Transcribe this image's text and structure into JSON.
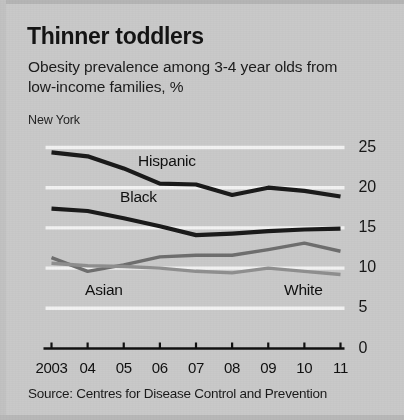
{
  "headline": "Thinner toddlers",
  "subtitle": "Obesity prevalence among 3-4 year olds from low-income families, %",
  "region": "New York",
  "source": "Source: Centres for Disease Control and Prevention",
  "colors": {
    "background": "#c9c9c9",
    "gridline": "#f2f2f2",
    "axis": "#111111",
    "dark_series": "#1a1a1a",
    "mid_series": "#6e6e6e",
    "light_series": "#8f8f8f",
    "text": "#141414"
  },
  "chart_data": {
    "type": "line",
    "title": "Thinner toddlers",
    "subtitle": "Obesity prevalence among 3-4 year olds from low-income families, %",
    "annotation": "New York",
    "source": "Source: Centres for Disease Control and Prevention",
    "xlabel": "",
    "ylabel": "",
    "x": [
      2003,
      2004,
      2005,
      2006,
      2007,
      2008,
      2009,
      2010,
      2011
    ],
    "tick_labels": [
      "2003",
      "04",
      "05",
      "06",
      "07",
      "08",
      "09",
      "10",
      "11"
    ],
    "ylim": [
      0,
      25
    ],
    "yticks": [
      0,
      5,
      10,
      15,
      20,
      25
    ],
    "ytick_labels": [
      "0",
      "5",
      "10",
      "15",
      "20",
      "25"
    ],
    "grid": "horizontal",
    "legend": "inline-labels",
    "series": [
      {
        "name": "Hispanic",
        "color": "#1a1a1a",
        "width": 4.2,
        "values": [
          24.4,
          23.9,
          22.4,
          20.5,
          20.4,
          19.1,
          20.0,
          19.6,
          18.9
        ]
      },
      {
        "name": "Black",
        "color": "#1a1a1a",
        "width": 4.2,
        "values": [
          17.4,
          17.1,
          16.2,
          15.2,
          14.1,
          14.3,
          14.6,
          14.8,
          14.9
        ]
      },
      {
        "name": "Asian",
        "color": "#6e6e6e",
        "width": 3.4,
        "values": [
          11.3,
          9.6,
          10.4,
          11.4,
          11.6,
          11.6,
          12.3,
          13.1,
          12.1
        ]
      },
      {
        "name": "White",
        "color": "#8f8f8f",
        "width": 3.4,
        "values": [
          10.6,
          10.3,
          10.2,
          10.0,
          9.6,
          9.4,
          10.0,
          9.6,
          9.2
        ]
      }
    ],
    "series_label_positions": [
      {
        "name": "Hispanic",
        "x": 138,
        "y": 152
      },
      {
        "name": "Black",
        "x": 120,
        "y": 188
      },
      {
        "name": "Asian",
        "x": 85,
        "y": 281
      },
      {
        "name": "White",
        "x": 284,
        "y": 281
      }
    ]
  }
}
